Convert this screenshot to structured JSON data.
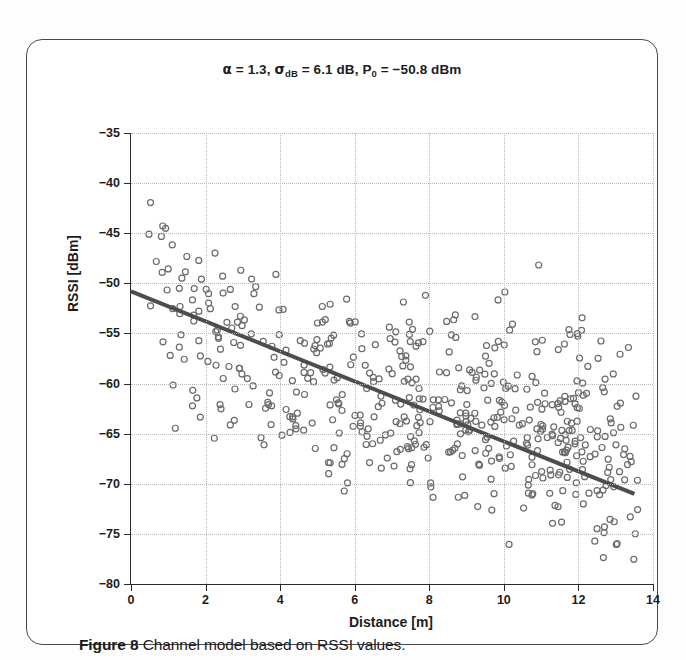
{
  "figure": {
    "caption_label": "Figure 8",
    "caption_text": "Channel model based on RSSI values."
  },
  "chart_data": {
    "type": "scatter",
    "title_parts": {
      "alpha_symbol": "α",
      "alpha_eq": " = 1.3,  ",
      "sigma_symbol": "σ",
      "sigma_sub": "dB",
      "sigma_eq": " = 6.1 dB,  ",
      "p_symbol": "P",
      "p_sub": "0",
      "p_eq": " = −50.8 dBm"
    },
    "xlabel": "Distance [m]",
    "ylabel": "RSSI [dBm]",
    "xlim": [
      0,
      14
    ],
    "ylim": [
      -80,
      -35
    ],
    "xticks": [
      0,
      2,
      4,
      6,
      8,
      10,
      12,
      14
    ],
    "xticklabels": [
      "0",
      "2",
      "4",
      "6",
      "8",
      "10",
      "12",
      "14"
    ],
    "yticks": [
      -35,
      -40,
      -45,
      -50,
      -55,
      -60,
      -65,
      -70,
      -75,
      -80
    ],
    "yticklabels": [
      "−35",
      "−40",
      "−45",
      "−50",
      "−55",
      "−60",
      "−65",
      "−70",
      "−75",
      "−80"
    ],
    "grid": true,
    "grid_style": "dotted",
    "grid_color": "#b9b9b9",
    "legend": null,
    "model": {
      "path_loss_exponent_alpha": 1.3,
      "shadowing_sigma_dB": 6.1,
      "reference_power_P0_dBm": -50.8,
      "equation": "RSSI = P0 - 10*alpha*log10(d)"
    },
    "fit_line": {
      "name": "log-distance path loss fit",
      "color": "#4d4d4d",
      "width_px": 4,
      "x_start": 0.0,
      "y_start": -50.8,
      "x_end": 13.5,
      "y_end": -71.0
    },
    "marker": {
      "shape": "circle-open",
      "color": "#6b6b6b",
      "size_px": 6,
      "line_width_px": 1.2
    },
    "n_points": 520,
    "point_x_range": [
      0.4,
      13.6
    ],
    "point_y_range": [
      -78.5,
      -37.2
    ],
    "generator": {
      "note": "points follow RSSI = P0 - 10*alpha*log10(d) + N(0, sigma), clipped to ylim",
      "seed": 20250817,
      "d_min": 0.4,
      "d_max": 13.6
    }
  }
}
